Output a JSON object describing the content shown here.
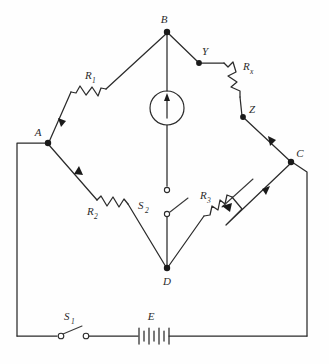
{
  "figure": {
    "type": "circuit-diagram",
    "name": "Wheatstone bridge circuit",
    "background_color": "#fefefe",
    "line_color": "#2b2b2b"
  },
  "nodes": [
    {
      "id": "B",
      "label": "B",
      "x": 167,
      "y": 32,
      "label_x": 164,
      "label_y": 23,
      "dot": true
    },
    {
      "id": "A",
      "label": "A",
      "x": 48,
      "y": 143,
      "label_x": 38,
      "label_y": 136,
      "dot": true
    },
    {
      "id": "C",
      "label": "C",
      "x": 291,
      "y": 162,
      "label_x": 298,
      "label_y": 156,
      "dot": true
    },
    {
      "id": "D",
      "label": "D",
      "x": 167,
      "y": 268,
      "label_x": 163,
      "label_y": 283,
      "dot": true
    },
    {
      "id": "Y",
      "label": "Y",
      "x": 199,
      "y": 63,
      "label_x": 203,
      "label_y": 54,
      "dot": true
    },
    {
      "id": "Z",
      "label": "Z",
      "x": 243,
      "y": 117,
      "label_x": 250,
      "label_y": 112,
      "dot": true
    }
  ],
  "components": [
    {
      "id": "R1",
      "name": "resistor-r1",
      "label": "R",
      "subscript": "1",
      "label_x": 88,
      "label_y": 79,
      "kind": "resistor",
      "branch": "B-A"
    },
    {
      "id": "R2",
      "name": "resistor-r2",
      "label": "R",
      "subscript": "2",
      "label_x": 92,
      "label_y": 215,
      "kind": "resistor",
      "branch": "A-D"
    },
    {
      "id": "R3",
      "name": "rheostat-r3",
      "label": "R",
      "subscript": "3",
      "label_x": 205,
      "label_y": 199,
      "kind": "rheostat",
      "branch": "D-C"
    },
    {
      "id": "Rx",
      "name": "unknown-resistor-rx",
      "label": "R",
      "subscript": "x",
      "label_x": 246,
      "label_y": 71,
      "kind": "resistor",
      "branch": "Y-Z"
    },
    {
      "id": "G",
      "name": "galvanometer",
      "label": "",
      "subscript": "",
      "kind": "galvanometer",
      "branch": "B-D",
      "center_x": 167,
      "center_y": 108,
      "radius": 17
    },
    {
      "id": "S2",
      "name": "switch-s2",
      "label": "S",
      "subscript": "2",
      "label_x": 140,
      "label_y": 209,
      "kind": "switch-open",
      "branch": "B-D"
    },
    {
      "id": "S1",
      "name": "switch-s1",
      "label": "S",
      "subscript": "1",
      "label_x": 65,
      "label_y": 320,
      "kind": "switch-open",
      "branch": "bottom-rail"
    },
    {
      "id": "E",
      "name": "battery",
      "label": "E",
      "subscript": "",
      "label_x": 148,
      "label_y": 320,
      "kind": "battery",
      "branch": "bottom-rail"
    }
  ],
  "current_arrows": [
    {
      "id": "arrow-b-a",
      "on": "B-A",
      "direction": "toward-A"
    },
    {
      "id": "arrow-a-d",
      "on": "A-D",
      "direction": "toward-A"
    },
    {
      "id": "arrow-z-c",
      "on": "Z-C",
      "direction": "toward-C"
    },
    {
      "id": "arrow-d-c",
      "on": "D-C",
      "direction": "toward-C"
    },
    {
      "id": "arrow-galvanometer",
      "on": "B-D",
      "direction": "upward"
    },
    {
      "id": "arrow-wiper-r3",
      "on": "R3-wiper",
      "direction": "into-resistor"
    }
  ]
}
